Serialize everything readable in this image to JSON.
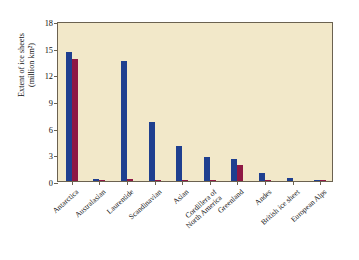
{
  "chart_data": {
    "type": "bar",
    "title": "",
    "xlabel": "",
    "ylabel_line1": "Extent of ice sheets",
    "ylabel_line2": "(million km²)",
    "ylim": [
      0,
      18
    ],
    "yticks": [
      0,
      3,
      6,
      9,
      12,
      15,
      18
    ],
    "grid": false,
    "legend": "none",
    "categories": [
      "Antarctica",
      "Australasian",
      "Laurentide",
      "Scandinavian",
      "Asian",
      "Cordillera of North America",
      "Greenland",
      "Andes",
      "British ice sheet",
      "European Alps"
    ],
    "category_label_lines": [
      [
        "Antarctica"
      ],
      [
        "Australasian"
      ],
      [
        "Laurentide"
      ],
      [
        "Scandinavian"
      ],
      [
        "Asian"
      ],
      [
        "Cordillera of",
        "North America"
      ],
      [
        "Greenland"
      ],
      [
        "Andes"
      ],
      [
        "British ice sheet"
      ],
      [
        "European Alps"
      ]
    ],
    "series": [
      {
        "name": "Last glacial maximum",
        "color": "#1f3f8f",
        "values": [
          14.5,
          0.2,
          13.5,
          6.6,
          3.9,
          2.7,
          2.5,
          0.9,
          0.35,
          0.04
        ]
      },
      {
        "name": "Present day",
        "color": "#8e1844",
        "values": [
          13.7,
          0.02,
          0.25,
          0.02,
          0.02,
          0.02,
          1.8,
          0.02,
          0.0,
          0.01
        ]
      }
    ],
    "annotations": [
      {
        "id": "southern-hemisphere",
        "label_lines": [
          "Southern",
          "Hemisphere"
        ],
        "spans_categories": [
          "Antarctica",
          "Australasian"
        ]
      },
      {
        "id": "northern-hemisphere",
        "label_lines": [
          "Northern",
          "Hemisphere"
        ],
        "spans_categories": [
          "Laurentide",
          "European Alps"
        ]
      }
    ]
  },
  "figure": {
    "background": "#ffffff",
    "plot_background": "#f2e8c9",
    "axis_color": "#6b6250",
    "blue": "#1f3f8f",
    "red": "#8e1844"
  },
  "ghost_text": "Glaciated Areas"
}
